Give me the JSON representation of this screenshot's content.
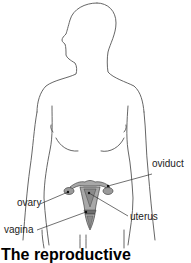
{
  "diagram": {
    "colors": {
      "outline": "#555555",
      "organ_fill": "#a8a8a8",
      "organ_dark": "#6e6e6e",
      "leader_line": "#333333",
      "background": "#ffffff"
    },
    "labels": {
      "oviduct": "oviduct",
      "ovary": "ovary",
      "uterus": "uterus",
      "vagina": "vagina"
    },
    "caption": "The reproductive"
  }
}
